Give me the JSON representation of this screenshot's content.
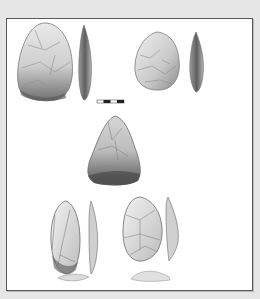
{
  "figure": {
    "type": "lithic-illustration-plate",
    "background_color": "#e6e6e6",
    "panel_color": "#ffffff",
    "panel_border_color": "#5a5a5a",
    "artifacts": [
      {
        "id": "A",
        "label": "",
        "views": [
          "face",
          "profile"
        ],
        "shape": "ovate-biface"
      },
      {
        "id": "B",
        "label": "",
        "views": [
          "face",
          "profile"
        ],
        "shape": "ovate-biface-small"
      },
      {
        "id": "C",
        "label": "",
        "views": [
          "face"
        ],
        "shape": "triangular-biface"
      },
      {
        "id": "D",
        "label": "",
        "views": [
          "face",
          "profile",
          "base"
        ],
        "shape": "elongated-flake-tool"
      },
      {
        "id": "E",
        "label": "",
        "views": [
          "face",
          "profile",
          "base"
        ],
        "shape": "ovate-flake-tool"
      }
    ],
    "scale_bar": {
      "segments": 4,
      "colors": [
        "#ffffff",
        "#222222",
        "#ffffff",
        "#222222"
      ]
    }
  }
}
